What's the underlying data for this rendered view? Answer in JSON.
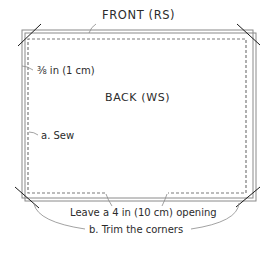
{
  "diagram": {
    "labels": {
      "front": "FRONT (RS)",
      "back": "BACK (WS)",
      "seam_allowance": "⅜ in (1 cm)",
      "sew": "a. Sew",
      "opening": "Leave a 4 in (10 cm) opening",
      "trim": "b. Trim the corners"
    },
    "colors": {
      "outline": "#8a8a8a",
      "stitch": "#7a7a7a",
      "trim_line": "#1a1a1a",
      "leader": "#8a8a8a",
      "text": "#2b2b2b"
    }
  }
}
